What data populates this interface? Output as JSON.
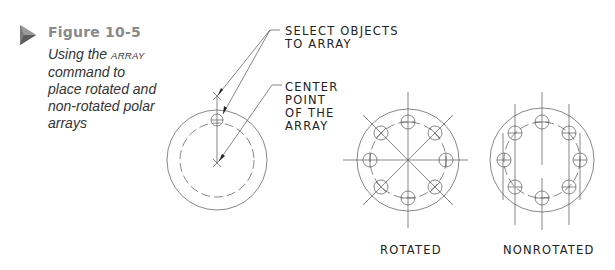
{
  "figure": {
    "label": "Figure 10-5",
    "caption_part1": "Using the ",
    "caption_command": "ARRAY",
    "caption_part2": " command to place rotated and non-rotated polar arrays",
    "marker_icon": "triangle-play-icon",
    "accent_color": "#8a8a8a"
  },
  "callouts": {
    "select_objects": [
      "SELECT OBJECTS",
      "TO ARRAY"
    ],
    "center_point": [
      "CENTER",
      "POINT",
      "OF THE",
      "ARRAY"
    ]
  },
  "views": [
    {
      "id": "source",
      "label": ""
    },
    {
      "id": "rotated",
      "label": "ROTATED"
    },
    {
      "id": "nonrotated",
      "label": "NONROTATED"
    }
  ]
}
